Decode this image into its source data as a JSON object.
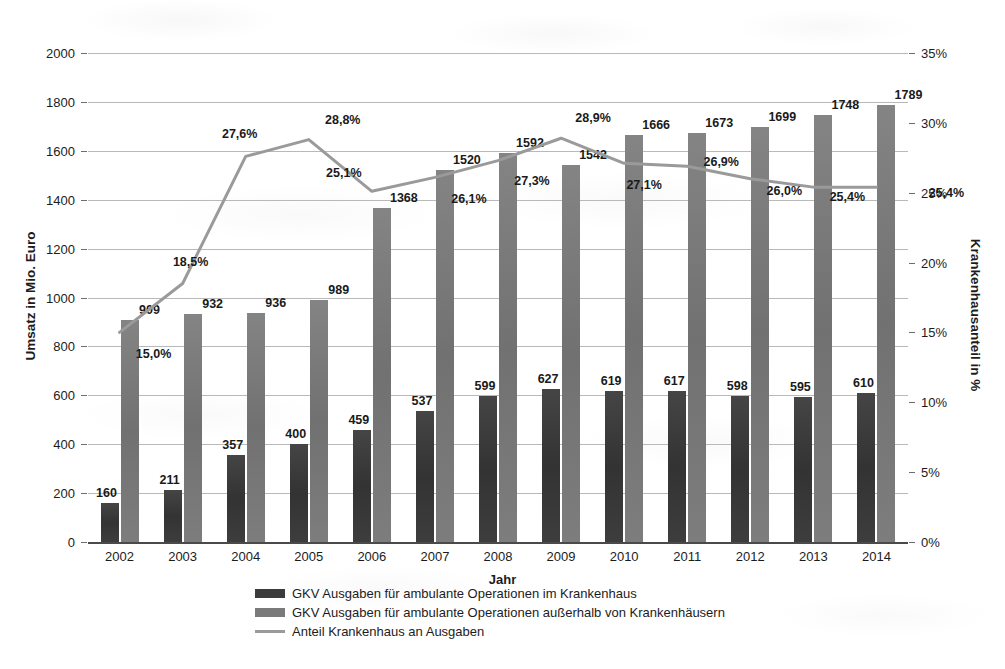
{
  "chart_data": {
    "type": "bar",
    "title": "",
    "subtitle": "",
    "xlabel": "Jahr",
    "ylabel": "Umsatz in Mio. Euro",
    "ylabel_secondary": "Krankenhausanteil in %",
    "categories": [
      "2002",
      "2003",
      "2004",
      "2005",
      "2006",
      "2007",
      "2008",
      "2009",
      "2010",
      "2011",
      "2012",
      "2013",
      "2014"
    ],
    "ylim": [
      0,
      2000
    ],
    "yticks": [
      "0",
      "200",
      "400",
      "600",
      "800",
      "1000",
      "1200",
      "1400",
      "1600",
      "1800",
      "2000"
    ],
    "ylim_secondary": [
      0,
      35
    ],
    "yticks_secondary": [
      "0%",
      "5%",
      "10%",
      "15%",
      "20%",
      "25%",
      "30%",
      "35%"
    ],
    "grid": true,
    "legend_position": "bottom",
    "series": [
      {
        "name": "GKV Ausgaben für ambulante Operationen im Krankenhaus",
        "type": "bar",
        "axis": "left",
        "color": "#3b3b3b",
        "values": [
          160,
          211,
          357,
          400,
          459,
          537,
          599,
          627,
          619,
          617,
          598,
          595,
          610
        ],
        "labels": [
          "160",
          "211",
          "357",
          "400",
          "459",
          "537",
          "599",
          "627",
          "619",
          "617",
          "598",
          "595",
          "610"
        ]
      },
      {
        "name": "GKV Ausgaben für ambulante Operationen außerhalb von Krankenhäusern",
        "type": "bar",
        "axis": "left",
        "color": "#7a7a7a",
        "values": [
          909,
          932,
          936,
          989,
          1368,
          1520,
          1592,
          1542,
          1666,
          1673,
          1699,
          1748,
          1789
        ],
        "labels": [
          "909",
          "932",
          "936",
          "989",
          "1368",
          "1520",
          "1592",
          "1542",
          "1666",
          "1673",
          "1699",
          "1748",
          "1789"
        ]
      },
      {
        "name": "Anteil Krankenhaus an Ausgaben",
        "type": "line",
        "axis": "right",
        "color": "#9a9a9a",
        "values": [
          15.0,
          18.5,
          27.6,
          28.8,
          25.1,
          26.1,
          27.3,
          28.9,
          27.1,
          26.9,
          26.0,
          25.4,
          25.4
        ],
        "labels": [
          "15,0%",
          "18,5%",
          "27,6%",
          "28,8%",
          "25,1%",
          "26,1%",
          "27,3%",
          "28,9%",
          "27,1%",
          "26,9%",
          "26,0%",
          "25,4%",
          "25,4%"
        ]
      }
    ]
  },
  "legend": {
    "items": [
      "GKV Ausgaben für ambulante Operationen im Krankenhaus",
      "GKV Ausgaben für ambulante Operationen außerhalb von Krankenhäusern",
      "Anteil Krankenhaus an Ausgaben"
    ]
  }
}
